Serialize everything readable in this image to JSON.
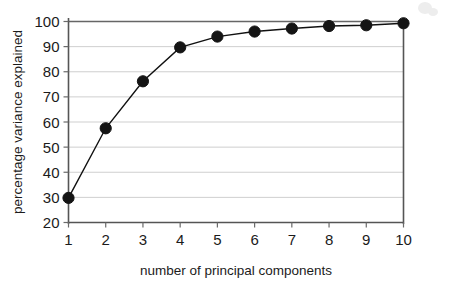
{
  "chart_data": {
    "type": "line",
    "title": "",
    "xlabel": "number of principal components",
    "ylabel": "percentage variance explained",
    "x": [
      1,
      2,
      3,
      4,
      5,
      6,
      7,
      8,
      9,
      10
    ],
    "values": [
      29.8,
      57.5,
      76.2,
      89.7,
      94.0,
      96.0,
      97.2,
      98.2,
      98.5,
      99.3
    ],
    "series": [
      {
        "name": "cumulative percentage variance explained",
        "values": [
          29.8,
          57.5,
          76.2,
          89.7,
          94.0,
          96.0,
          97.2,
          98.2,
          98.5,
          99.3
        ]
      }
    ],
    "xlim": [
      1,
      10
    ],
    "ylim": [
      20,
      100
    ],
    "xticks": [
      "1",
      "2",
      "3",
      "4",
      "5",
      "6",
      "7",
      "8",
      "9",
      "10"
    ],
    "yticks": [
      "20",
      "30",
      "40",
      "50",
      "60",
      "70",
      "80",
      "90",
      "100"
    ],
    "ytick_values": [
      20,
      30,
      40,
      50,
      60,
      70,
      80,
      90,
      100
    ],
    "grid": "horizontal",
    "legend": "none",
    "marker": "filled-circle",
    "marker_color": "#141414",
    "line_color": "#111111",
    "grid_color": "#c9c9c9",
    "axis_color": "#555555",
    "background": "#ffffff"
  },
  "axes": {
    "x_title": "number of principal components",
    "y_title": "percentage variance explained"
  }
}
